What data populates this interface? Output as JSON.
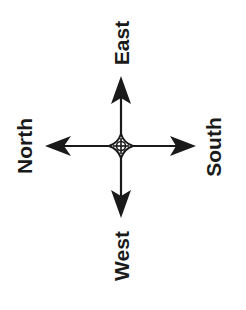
{
  "diagram": {
    "type": "compass-rose",
    "orientation": "rotated -90 degrees",
    "ink_color": "#1a1a1a",
    "background": "#ffffff",
    "labels": {
      "top": "East",
      "bottom": "West",
      "left": "North",
      "right": "South"
    },
    "arrows": [
      {
        "direction": "up",
        "points_to": "East"
      },
      {
        "direction": "down",
        "points_to": "West"
      },
      {
        "direction": "left",
        "points_to": "North"
      },
      {
        "direction": "right",
        "points_to": "South"
      }
    ]
  }
}
